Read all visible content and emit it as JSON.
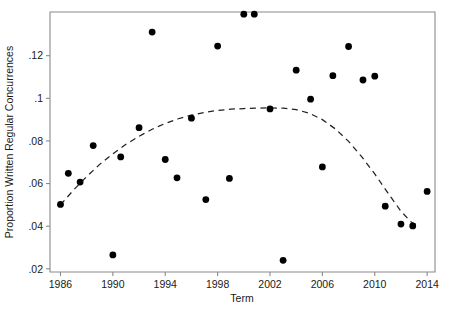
{
  "chart_data": {
    "type": "scatter",
    "title": "",
    "xlabel": "Term",
    "ylabel": "Proportion Written Regular Concurrences",
    "xlim": [
      1985.2,
      2014.6
    ],
    "ylim": [
      0.0185,
      0.1405
    ],
    "grid": false,
    "legend": null,
    "xticks": [
      1986,
      1990,
      1994,
      1998,
      2002,
      2006,
      2010,
      2014
    ],
    "xticklabels": [
      "1986",
      "1990",
      "1994",
      "1998",
      "2002",
      "2006",
      "2010",
      "2014"
    ],
    "yticks": [
      0.02,
      0.04,
      0.06,
      0.08,
      0.1,
      0.12
    ],
    "yticklabels": [
      ".02",
      ".04",
      ".06",
      ".08",
      ".1",
      ".12"
    ],
    "marker": "filled-circle",
    "marker_color": "#000000",
    "points": [
      {
        "x": 1986.0,
        "y": 0.0502
      },
      {
        "x": 1986.6,
        "y": 0.0648
      },
      {
        "x": 1987.5,
        "y": 0.0607
      },
      {
        "x": 1988.5,
        "y": 0.0778
      },
      {
        "x": 1990.0,
        "y": 0.0265
      },
      {
        "x": 1990.6,
        "y": 0.0725
      },
      {
        "x": 1992.0,
        "y": 0.0862
      },
      {
        "x": 1993.0,
        "y": 0.1311
      },
      {
        "x": 1994.0,
        "y": 0.0713
      },
      {
        "x": 1994.9,
        "y": 0.0627
      },
      {
        "x": 1996.0,
        "y": 0.0907
      },
      {
        "x": 1997.1,
        "y": 0.0525
      },
      {
        "x": 1998.0,
        "y": 0.1245
      },
      {
        "x": 1998.9,
        "y": 0.0624
      },
      {
        "x": 2000.0,
        "y": 0.1395
      },
      {
        "x": 2000.8,
        "y": 0.1395
      },
      {
        "x": 2002.0,
        "y": 0.095
      },
      {
        "x": 2003.0,
        "y": 0.024
      },
      {
        "x": 2004.0,
        "y": 0.1132
      },
      {
        "x": 2005.1,
        "y": 0.0996
      },
      {
        "x": 2006.0,
        "y": 0.0678
      },
      {
        "x": 2006.8,
        "y": 0.1106
      },
      {
        "x": 2008.0,
        "y": 0.1243
      },
      {
        "x": 2009.1,
        "y": 0.1086
      },
      {
        "x": 2010.0,
        "y": 0.1104
      },
      {
        "x": 2010.8,
        "y": 0.0494
      },
      {
        "x": 2012.0,
        "y": 0.041
      },
      {
        "x": 2012.9,
        "y": 0.0401
      },
      {
        "x": 2014.0,
        "y": 0.0563
      }
    ],
    "fit": {
      "style": "dashed",
      "kind": "quadratic-trend",
      "color": "#222222",
      "xy": [
        [
          1986.0,
          0.05
        ],
        [
          1987.0,
          0.057
        ],
        [
          1988.0,
          0.0633
        ],
        [
          1989.0,
          0.069
        ],
        [
          1990.0,
          0.074
        ],
        [
          1991.0,
          0.0784
        ],
        [
          1992.0,
          0.0822
        ],
        [
          1993.0,
          0.0855
        ],
        [
          1994.0,
          0.0882
        ],
        [
          1995.0,
          0.0904
        ],
        [
          1996.0,
          0.0921
        ],
        [
          1997.0,
          0.0934
        ],
        [
          1998.0,
          0.0943
        ],
        [
          1999.0,
          0.0949
        ],
        [
          2000.0,
          0.0952
        ],
        [
          2001.0,
          0.0954
        ],
        [
          2002.0,
          0.0955
        ],
        [
          2003.0,
          0.0954
        ],
        [
          2004.0,
          0.0947
        ],
        [
          2005.0,
          0.093
        ],
        [
          2006.0,
          0.09
        ],
        [
          2007.0,
          0.0856
        ],
        [
          2008.0,
          0.0798
        ],
        [
          2009.0,
          0.0726
        ],
        [
          2010.0,
          0.0645
        ],
        [
          2011.0,
          0.0556
        ],
        [
          2012.0,
          0.047
        ],
        [
          2012.8,
          0.0418
        ],
        [
          2013.4,
          0.04
        ]
      ]
    }
  }
}
